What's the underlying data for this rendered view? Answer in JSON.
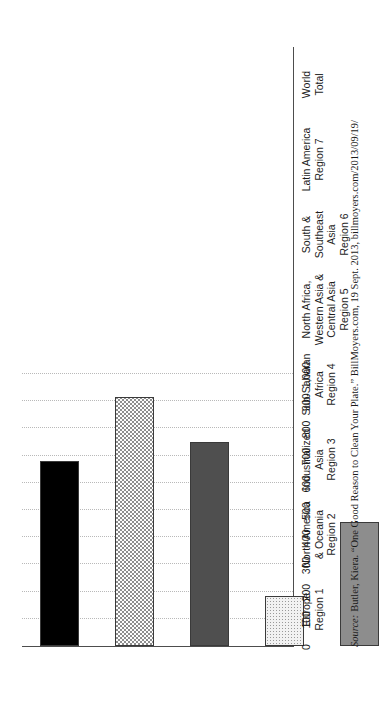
{
  "chart_data": {
    "type": "bar",
    "orientation": "vertical-rotated",
    "title": "",
    "xlabel": "",
    "ylabel": "",
    "ylim": [
      0,
      1000
    ],
    "grid": true,
    "legend": "none",
    "categories": [
      "Europe\nRegion 1",
      "North America\n& Oceania\nRegion 2",
      "Industrialized\nAsia\nRegion 3",
      "Sub-Saharan\nAfrica\nRegion 4",
      "North Africa,\nWestern Asia &\nCentral Asia\nRegion 5",
      "South &\nSoutheast\nAsia\nRegion 6",
      "Latin America\nRegion 7",
      "World\nTotal"
    ],
    "values": [
      680,
      915,
      750,
      185,
      455,
      300,
      495,
      470
    ],
    "tick_labels": [
      "1,000",
      "900",
      "800",
      "700",
      "600",
      "500",
      "400",
      "300",
      "200",
      "100",
      "0"
    ],
    "tick_values": [
      1000,
      900,
      800,
      700,
      600,
      500,
      400,
      300,
      200,
      100,
      0
    ],
    "fills": [
      "solid-black",
      "checkerboard",
      "dark-gray",
      "light-dots",
      "medium-gray",
      "grid-crosshatch",
      "white",
      "diagonal-hatch"
    ]
  },
  "source": {
    "label": "Source:",
    "text": "Butler, Kiera. “One Good Reason to Clean Your Plate.” BillMoyers.com, 19 Sept. 2013, billmoyers.com/2013/09/19/"
  }
}
